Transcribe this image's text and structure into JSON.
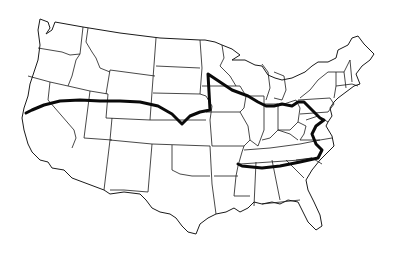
{
  "map": {
    "title": "United States route map",
    "description": "Outline map of the contiguous United States with state borders and a bold route line",
    "colors": {
      "background": "#ffffff",
      "borders": "#1a1a1a",
      "route": "#0a0a0a"
    },
    "route": {
      "label": "Route",
      "waypoints_approx": [
        "Northern California coast",
        "Nevada",
        "Utah",
        "Colorado",
        "Kansas",
        "Nebraska",
        "Minnesota",
        "Wisconsin",
        "Illinois",
        "Indiana",
        "Ohio",
        "Pennsylvania",
        "Maryland",
        "Virginia",
        "North Carolina",
        "Tennessee"
      ]
    }
  }
}
